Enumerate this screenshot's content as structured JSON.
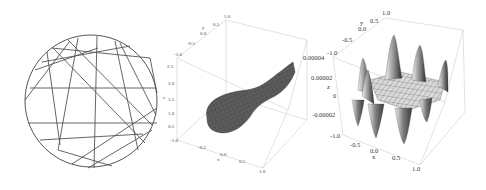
{
  "chart_data": [
    {
      "type": "line",
      "title": "",
      "description": "Circle with inscribed chords (2D line drawing)",
      "circle": {
        "cx": 91,
        "cy": 101,
        "r": 66
      },
      "chords": [
        [
          [
            28,
            123
          ],
          [
            157,
            123
          ]
        ],
        [
          [
            47,
            52
          ],
          [
            60,
            145
          ]
        ],
        [
          [
            52,
            48
          ],
          [
            150,
            58
          ]
        ],
        [
          [
            78,
            38
          ],
          [
            58,
            150
          ]
        ],
        [
          [
            97,
            36
          ],
          [
            94,
            168
          ]
        ],
        [
          [
            42,
            62
          ],
          [
            130,
            46
          ]
        ],
        [
          [
            30,
            88
          ],
          [
            156,
            88
          ]
        ],
        [
          [
            35,
            70
          ],
          [
            98,
            48
          ]
        ],
        [
          [
            53,
            48
          ],
          [
            145,
            143
          ]
        ],
        [
          [
            68,
            40
          ],
          [
            152,
            125
          ]
        ],
        [
          [
            115,
            41
          ],
          [
            138,
            150
          ]
        ],
        [
          [
            120,
            43
          ],
          [
            156,
            115
          ]
        ],
        [
          [
            40,
            140
          ],
          [
            143,
            134
          ]
        ],
        [
          [
            72,
            164
          ],
          [
            157,
            108
          ]
        ],
        [
          [
            88,
            168
          ],
          [
            152,
            130
          ]
        ],
        [
          [
            58,
            150
          ],
          [
            112,
            166
          ]
        ],
        [
          [
            25,
            100
          ],
          [
            70,
            41
          ]
        ],
        [
          [
            150,
            58
          ],
          [
            157,
            93
          ]
        ]
      ],
      "axes": "none"
    },
    {
      "type": "surface3d",
      "title": "",
      "description": "Teardrop-shaped dark gray mesh surface inside 3D bounding box",
      "axes": {
        "top_edge_ticks": [
          "-1.0",
          "-0.5",
          "0.0",
          "0.5",
          "1.0"
        ],
        "top_edge_label": "y",
        "vertical_ticks": [
          "0.5",
          "1.0",
          "1.5",
          "2.0",
          "2.5"
        ],
        "vertical_label": "z",
        "bottom_edge_ticks": [
          "-1.0",
          "-0.5",
          "0.0",
          "0.5",
          "1.0"
        ],
        "bottom_edge_label": "x"
      },
      "surface_color": "#5a5a5a"
    },
    {
      "type": "surface3d",
      "title": "",
      "description": "Oscillating surface with tall peaks around edges and flat mesh center",
      "axes": {
        "top_edge_ticks": [
          "-1.0",
          "-0.5",
          "0.0",
          "0.5",
          "1.0"
        ],
        "top_edge_label": "y",
        "vertical_ticks": [
          "-0.00002",
          "0",
          "0.00002",
          "0.00004"
        ],
        "vertical_label": "z",
        "bottom_edge_ticks": [
          "-1.0",
          "-0.5",
          "0.0",
          "0.5",
          "1.0"
        ],
        "bottom_edge_label": "x"
      },
      "zlim": [
        -3e-05,
        4e-05
      ],
      "surface_color": "#cfcfcf"
    }
  ],
  "labels": {
    "p2": {
      "y_top": [
        "-1.0",
        "-0.5",
        "0.0",
        "0.5",
        "1.0"
      ],
      "y_name": "y",
      "z_ticks": [
        "2.5",
        "2.0",
        "1.5",
        "1.0",
        "0.5"
      ],
      "z_name": "z",
      "x_bottom": [
        "-1.0",
        "-0.5",
        "0.0",
        "0.5",
        "1.0"
      ],
      "x_name": "x"
    },
    "p3": {
      "y_top": [
        "-1.0",
        "-0.5",
        "0.0",
        "0.5",
        "1.0"
      ],
      "y_name": "y",
      "z_ticks": [
        "0.00004",
        "0.00002",
        "0",
        "-0.00002"
      ],
      "z_name": "z",
      "x_bottom": [
        "-1.0",
        "-0.5",
        "0.0",
        "0.5",
        "1.0"
      ],
      "x_name": "x"
    }
  }
}
